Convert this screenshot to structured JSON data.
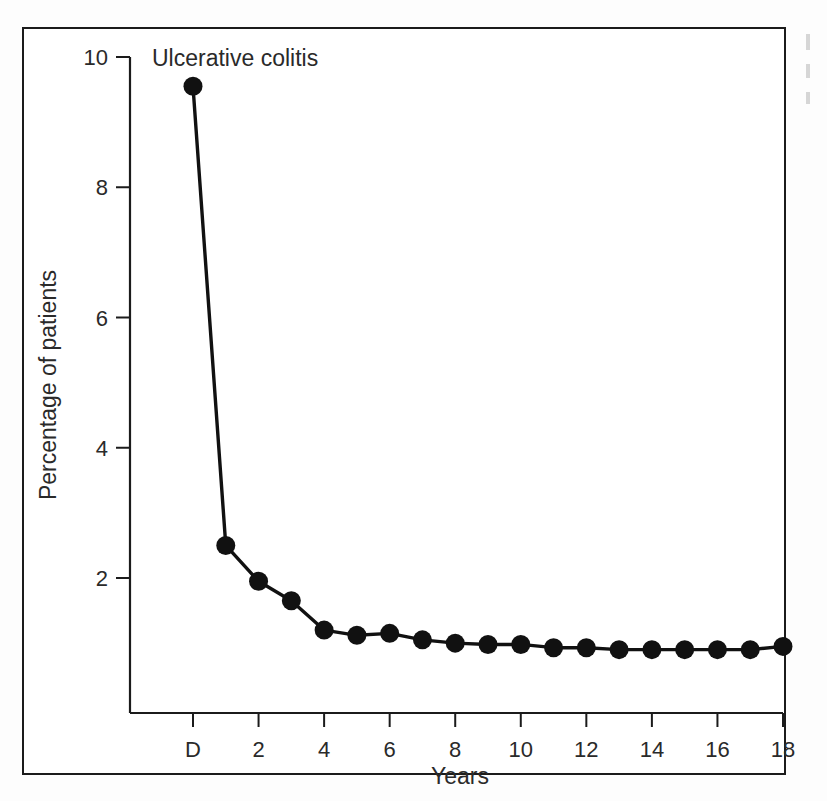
{
  "figure": {
    "panel_title": "Ulcerative colitis"
  },
  "chart_data": {
    "type": "line",
    "title": "Ulcerative colitis",
    "xlabel": "Years",
    "ylabel": "Percentage of patients",
    "xlim": [
      0,
      19
    ],
    "ylim": [
      0,
      10
    ],
    "grid": false,
    "legend": null,
    "marker": "filled-circle",
    "x_tick_labels": [
      "D",
      "2",
      "4",
      "6",
      "8",
      "10",
      "12",
      "14",
      "16",
      "18"
    ],
    "x_tick_values": [
      0,
      2,
      4,
      6,
      8,
      10,
      12,
      14,
      16,
      18
    ],
    "y_tick_labels": [
      "2",
      "4",
      "6",
      "8",
      "10"
    ],
    "y_tick_values": [
      2,
      4,
      6,
      8,
      10
    ],
    "x": [
      0,
      1,
      2,
      3,
      4,
      5,
      6,
      7,
      8,
      9,
      10,
      11,
      12,
      13,
      14,
      15,
      16,
      17,
      18
    ],
    "values": [
      9.55,
      2.5,
      1.95,
      1.65,
      1.2,
      1.12,
      1.15,
      1.05,
      1.0,
      0.98,
      0.98,
      0.93,
      0.93,
      0.9,
      0.9,
      0.9,
      0.9,
      0.9,
      0.95
    ],
    "series": [
      {
        "name": "Ulcerative colitis",
        "values": [
          9.55,
          2.5,
          1.95,
          1.65,
          1.2,
          1.12,
          1.15,
          1.05,
          1.0,
          0.98,
          0.98,
          0.93,
          0.93,
          0.9,
          0.9,
          0.9,
          0.9,
          0.9,
          0.95
        ]
      }
    ]
  }
}
